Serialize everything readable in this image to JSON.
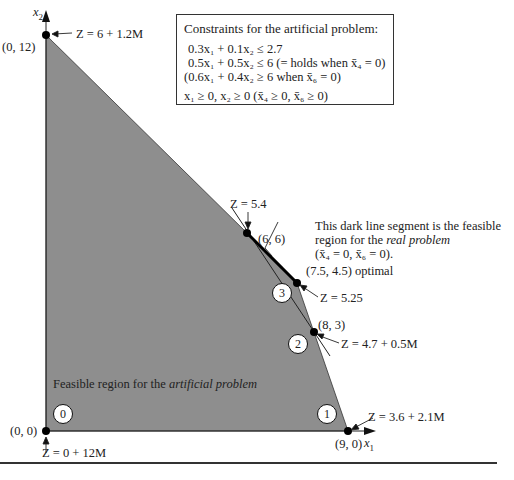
{
  "axes": {
    "x_label": "x",
    "x_sub": "1",
    "y_label": "x",
    "y_sub": "2"
  },
  "constraints_box": {
    "title": "Constraints for the artificial problem:",
    "rows": [
      "0.3x₁ + 0.1x₂ ≤ 2.7",
      "0.5x₁ + 0.5x₂ ≤ 6 (= holds when x̄₄ = 0)",
      "(0.6x₁ + 0.4x₂ ≥ 6 when x̄₆ = 0)",
      "x₁ ≥ 0,  x₂ ≥ 0  (x̄₄ ≥ 0,  x̄₆ ≥ 0)"
    ]
  },
  "points": [
    {
      "id": "p0",
      "coord": "(0, 0)",
      "z": "Z = 0 + 12M",
      "step": "0"
    },
    {
      "id": "p1",
      "coord": "(9, 0)",
      "z": "Z = 3.6 + 2.1M",
      "step": "1"
    },
    {
      "id": "p2",
      "coord": "(8, 3)",
      "z": "Z = 4.7 + 0.5M",
      "step": "2"
    },
    {
      "id": "p3",
      "coord": "(7.5, 4.5) optimal",
      "z": "Z = 5.25",
      "step": "3"
    },
    {
      "id": "p4",
      "coord": "(6, 6)",
      "z": "Z = 5.4"
    },
    {
      "id": "p5",
      "coord": "(0, 12)",
      "z": "Z = 6 + 1.2M"
    }
  ],
  "annotations": {
    "segment_line1": "This dark line segment is the feasible",
    "segment_line2_pre": "region for the ",
    "segment_line2_it": "real problem",
    "segment_line3": "(x̄₄ = 0, x̄₆ = 0).",
    "feasible_pre": "Feasible region for the ",
    "feasible_it": "artificial problem"
  },
  "colors": {
    "region_fill": "#8e8e8e",
    "line": "#111111"
  }
}
